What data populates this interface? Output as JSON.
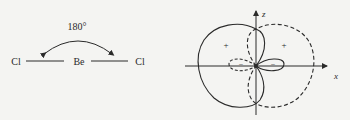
{
  "left_diagram": {
    "angle_label": "180°",
    "atoms": [
      "Cl",
      "Be",
      "Cl"
    ]
  },
  "right_diagram": {
    "axis_z_label": "z",
    "axis_x_label": "x",
    "plus_left": "+",
    "plus_right": "+",
    "minus_left": "−",
    "minus_right": "−"
  }
}
